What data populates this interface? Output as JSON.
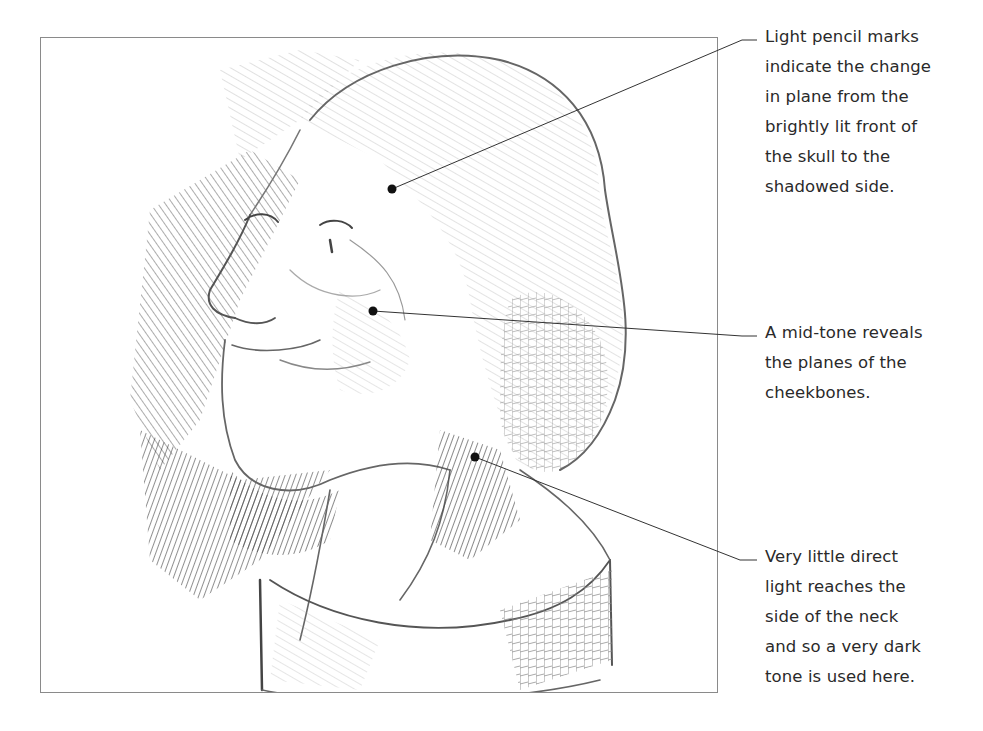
{
  "figure": {
    "frame_border_color": "#8a8a8a",
    "leader_line_color": "#333333",
    "marker_color": "#111111"
  },
  "annotations": [
    {
      "id": "skull-plane",
      "lines": [
        "Light pencil marks",
        "indicate the change",
        "in plane from the",
        "brightly lit front of",
        "the skull to the",
        "shadowed side."
      ],
      "marker": {
        "x": 392,
        "y": 189
      },
      "elbow": {
        "x": 742,
        "y": 40
      },
      "end": {
        "x": 757,
        "y": 40
      },
      "text_top": 22
    },
    {
      "id": "cheekbones",
      "lines": [
        "A mid-tone reveals",
        "the planes of the",
        "cheekbones."
      ],
      "marker": {
        "x": 373,
        "y": 311
      },
      "elbow": {
        "x": 742,
        "y": 336
      },
      "end": {
        "x": 757,
        "y": 336
      },
      "text_top": 318
    },
    {
      "id": "neck-shadow",
      "lines": [
        "Very little direct",
        "light reaches the",
        "side of the neck",
        "and so a very dark",
        "tone is used here."
      ],
      "marker": {
        "x": 475,
        "y": 457
      },
      "elbow": {
        "x": 740,
        "y": 560
      },
      "end": {
        "x": 757,
        "y": 560
      },
      "text_top": 542
    }
  ]
}
